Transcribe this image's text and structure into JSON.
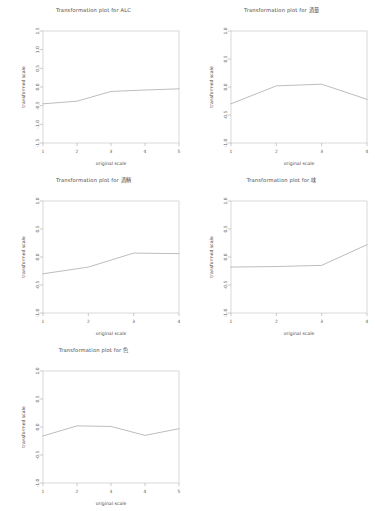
{
  "page": {
    "background_color": "#ffffff",
    "line_color": "#8e8e8e",
    "axis_color": "#9a9a9a",
    "text_color": "#4a4a4a",
    "width": 375,
    "height": 511
  },
  "chart_data": [
    {
      "id": "plot-alc",
      "type": "line",
      "title": "Transformation plot for ALC",
      "xlabel": "original scale",
      "ylabel": "transformed scale",
      "xticks": [
        1,
        2,
        3,
        4,
        5
      ],
      "yticks": [
        -1.5,
        -1.0,
        -0.5,
        0.0,
        0.5,
        1.0,
        1.5
      ],
      "xlim": [
        1,
        5
      ],
      "ylim": [
        -1.5,
        1.5
      ],
      "grid": false,
      "legend": "none",
      "x": [
        1,
        2,
        3,
        4,
        5
      ],
      "values": [
        -0.45,
        -0.38,
        -0.12,
        -0.08,
        -0.05
      ]
    },
    {
      "id": "plot-jiuliang",
      "type": "line",
      "title": "Transformation plot for 酒量",
      "xlabel": "original scale",
      "ylabel": "transformed scale",
      "xticks": [
        1,
        2,
        3,
        4
      ],
      "yticks": [
        1.0,
        0.5,
        0.0,
        -0.5,
        -1.0
      ],
      "xlim": [
        1,
        4
      ],
      "ylim": [
        -1.0,
        1.0
      ],
      "grid": false,
      "legend": "none",
      "x": [
        1,
        2,
        3,
        4
      ],
      "values": [
        -0.3,
        0.02,
        0.05,
        -0.22
      ]
    },
    {
      "id": "plot-jiujing",
      "type": "line",
      "title": "Transformation plot for 酒精",
      "xlabel": "original scale",
      "ylabel": "transformed scale",
      "xticks": [
        1,
        2,
        3,
        4
      ],
      "yticks": [
        -1.0,
        -0.5,
        0.0,
        0.5,
        1.0
      ],
      "xlim": [
        1,
        4
      ],
      "ylim": [
        -1.0,
        1.0
      ],
      "grid": false,
      "legend": "none",
      "x": [
        1,
        2,
        3,
        4
      ],
      "values": [
        -0.3,
        -0.18,
        0.07,
        0.06
      ]
    },
    {
      "id": "plot-wei",
      "type": "line",
      "title": "Transformation plot for 味",
      "xlabel": "original scale",
      "ylabel": "transformed scale",
      "xticks": [
        1,
        2,
        3,
        4
      ],
      "yticks": [
        -1.0,
        -0.5,
        0.0,
        0.5,
        1.0
      ],
      "xlim": [
        1,
        4
      ],
      "ylim": [
        -1.0,
        1.0
      ],
      "grid": false,
      "legend": "none",
      "x": [
        1,
        2,
        3,
        4
      ],
      "values": [
        -0.18,
        -0.17,
        -0.15,
        0.22
      ]
    },
    {
      "id": "plot-se",
      "type": "line",
      "title": "Transformation plot for 色",
      "xlabel": "original scale",
      "ylabel": "transformed scale",
      "xticks": [
        1,
        2,
        3,
        4,
        5
      ],
      "yticks": [
        -1.0,
        -0.5,
        0.0,
        0.5,
        1.0
      ],
      "xlim": [
        1,
        5
      ],
      "ylim": [
        -1.0,
        1.0
      ],
      "grid": false,
      "legend": "none",
      "x": [
        1,
        2,
        3,
        4,
        5
      ],
      "values": [
        -0.16,
        0.02,
        0.01,
        -0.15,
        -0.03
      ]
    }
  ]
}
